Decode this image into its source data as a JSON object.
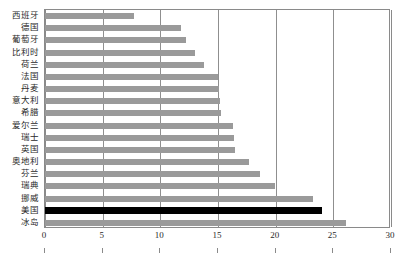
{
  "chart_data": {
    "type": "bar",
    "orientation": "horizontal",
    "title": "",
    "subtitle": "",
    "xlabel": "",
    "ylabel": "",
    "xlim": [
      0,
      30
    ],
    "ylim": null,
    "grid": true,
    "legend": null,
    "xticks": [
      0,
      5,
      10,
      15,
      20,
      25,
      30
    ],
    "xtick_labels": [
      "0",
      "5",
      "10",
      "15",
      "20",
      "25",
      "30"
    ],
    "categories": [
      "西班牙",
      "德国",
      "葡萄牙",
      "比利时",
      "荷兰",
      "法国",
      "丹麦",
      "意大利",
      "希腊",
      "爱尔兰",
      "瑞士",
      "英国",
      "奥地利",
      "芬兰",
      "瑞典",
      "挪威",
      "美国",
      "冰岛"
    ],
    "values": [
      7.7,
      11.8,
      12.2,
      13.0,
      13.8,
      15.0,
      15.1,
      15.2,
      15.3,
      16.3,
      16.4,
      16.5,
      17.7,
      18.6,
      19.9,
      23.2,
      24.0,
      26.1
    ],
    "highlight_category": "美国",
    "colors": {
      "bar": "#9a9a9a",
      "highlight_bar": "#000000",
      "gridline": "#8f8f8f",
      "axis": "#8a8a8a",
      "text": "#2a2a2a",
      "background": "#ffffff"
    }
  }
}
